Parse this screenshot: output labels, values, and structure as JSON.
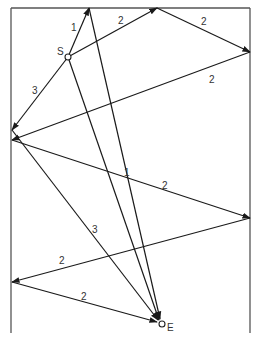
{
  "diagram": {
    "type": "ray-reflection-paths",
    "box": {
      "left": 11,
      "right": 250,
      "top": 8,
      "bottom": 333
    },
    "source": {
      "label": "S",
      "x": 68,
      "y": 57
    },
    "end": {
      "label": "E",
      "x": 162,
      "y": 324
    },
    "paths": [
      {
        "name": "path-1",
        "order": "1",
        "points": [
          [
            68,
            57
          ],
          [
            89,
            8
          ],
          [
            162,
            324
          ]
        ],
        "labels": [
          {
            "text": "1",
            "x": 71,
            "y": 31
          },
          {
            "text": "1",
            "x": 124,
            "y": 176
          }
        ]
      },
      {
        "name": "path-2",
        "order": "2",
        "points": [
          [
            68,
            57
          ],
          [
            157,
            8
          ],
          [
            250,
            52
          ],
          [
            12,
            140
          ],
          [
            250,
            218
          ],
          [
            12,
            282
          ],
          [
            162,
            324
          ]
        ],
        "labels": [
          {
            "text": "2",
            "x": 118,
            "y": 24
          },
          {
            "text": "2",
            "x": 201,
            "y": 25
          },
          {
            "text": "2",
            "x": 209,
            "y": 83
          },
          {
            "text": "2",
            "x": 162,
            "y": 189
          },
          {
            "text": "2",
            "x": 59,
            "y": 264
          },
          {
            "text": "2",
            "x": 81,
            "y": 300
          }
        ]
      },
      {
        "name": "path-3",
        "order": "3",
        "points": [
          [
            68,
            57
          ],
          [
            12,
            130
          ],
          [
            162,
            324
          ]
        ],
        "labels": [
          {
            "text": "3",
            "x": 32,
            "y": 94
          },
          {
            "text": "3",
            "x": 92,
            "y": 233
          }
        ]
      }
    ]
  },
  "text": {
    "source_label": "S",
    "end_label": "E",
    "p1_l1": "1",
    "p1_l2": "1",
    "p2_l1": "2",
    "p2_l2": "2",
    "p2_l3": "2",
    "p2_l4": "2",
    "p2_l5": "2",
    "p2_l6": "2",
    "p3_l1": "3",
    "p3_l2": "3"
  }
}
